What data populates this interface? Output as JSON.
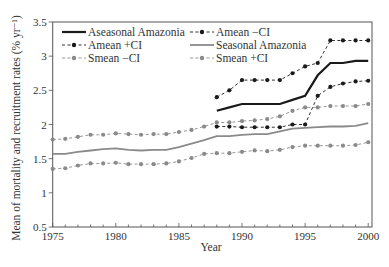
{
  "chart_data": {
    "type": "line",
    "title": "",
    "xlabel": "Year",
    "ylabel": "Mean of mortality and recruitment rates (% yr⁻¹)",
    "xlim": [
      1975,
      2000.3
    ],
    "ylim": [
      0.5,
      3.5
    ],
    "xticks": [
      1975,
      1980,
      1985,
      1990,
      1995,
      2000
    ],
    "xtick_labels": [
      "1975",
      "1980",
      "1985",
      "1990",
      "1995",
      "2000"
    ],
    "yticks": [
      0.5,
      1,
      1.5,
      2,
      2.5,
      3,
      3.5
    ],
    "ytick_labels": [
      "0.5",
      "1",
      "1.5",
      "2",
      "2.5",
      "3",
      "3.5"
    ],
    "grid": false,
    "legend_position": "upper left (inside, 3 columns x 2 rows)",
    "series": [
      {
        "name": "Aseasonal Amazonia",
        "style": "solid",
        "color": "#1a1a1a",
        "marker": "none",
        "width": 2.2,
        "x": [
          1988,
          1989,
          1990,
          1991,
          1992,
          1993,
          1994,
          1995,
          1996,
          1997,
          1998,
          1999,
          2000
        ],
        "values": [
          2.2,
          2.25,
          2.3,
          2.3,
          2.3,
          2.3,
          2.36,
          2.42,
          2.72,
          2.9,
          2.9,
          2.93,
          2.93
        ]
      },
      {
        "name": "Amean −CI",
        "style": "dashed",
        "color": "#1a1a1a",
        "marker": "dot",
        "x": [
          1988,
          1989,
          1990,
          1991,
          1992,
          1993,
          1994,
          1995,
          1996,
          1997,
          1998,
          1999,
          2000
        ],
        "values": [
          1.97,
          1.97,
          1.96,
          1.96,
          1.96,
          1.96,
          2.0,
          2.0,
          2.42,
          2.55,
          2.6,
          2.63,
          2.64
        ]
      },
      {
        "name": "Amean +CI",
        "style": "dashed",
        "color": "#1a1a1a",
        "marker": "dot",
        "x": [
          1988,
          1989,
          1990,
          1991,
          1992,
          1993,
          1994,
          1995,
          1996,
          1997,
          1998,
          1999,
          2000
        ],
        "values": [
          2.4,
          2.5,
          2.65,
          2.65,
          2.65,
          2.65,
          2.75,
          2.85,
          2.9,
          3.23,
          3.23,
          3.23,
          3.23
        ]
      },
      {
        "name": "Seasonal Amazonia",
        "style": "solid",
        "color": "#8a8a8a",
        "marker": "none",
        "width": 1.8,
        "x": [
          1975,
          1976,
          1977,
          1978,
          1979,
          1980,
          1981,
          1982,
          1983,
          1984,
          1985,
          1986,
          1987,
          1988,
          1989,
          1990,
          1991,
          1992,
          1993,
          1994,
          1995,
          1996,
          1997,
          1998,
          1999,
          2000
        ],
        "values": [
          1.57,
          1.57,
          1.6,
          1.62,
          1.64,
          1.65,
          1.63,
          1.62,
          1.63,
          1.63,
          1.67,
          1.72,
          1.77,
          1.83,
          1.83,
          1.85,
          1.86,
          1.86,
          1.9,
          1.94,
          1.95,
          1.96,
          1.97,
          1.97,
          1.98,
          2.02
        ]
      },
      {
        "name": "Smean −CI",
        "style": "dashed",
        "color": "#8a8a8a",
        "marker": "dot",
        "x": [
          1975,
          1976,
          1977,
          1978,
          1979,
          1980,
          1981,
          1982,
          1983,
          1984,
          1985,
          1986,
          1987,
          1988,
          1989,
          1990,
          1991,
          1992,
          1993,
          1994,
          1995,
          1996,
          1997,
          1998,
          1999,
          2000
        ],
        "values": [
          1.35,
          1.36,
          1.4,
          1.43,
          1.43,
          1.44,
          1.42,
          1.42,
          1.42,
          1.43,
          1.46,
          1.51,
          1.57,
          1.58,
          1.58,
          1.6,
          1.62,
          1.61,
          1.63,
          1.67,
          1.69,
          1.69,
          1.69,
          1.69,
          1.7,
          1.74
        ]
      },
      {
        "name": "Smean +CI",
        "style": "dashed",
        "color": "#8a8a8a",
        "marker": "dot",
        "x": [
          1975,
          1976,
          1977,
          1978,
          1979,
          1980,
          1981,
          1982,
          1983,
          1984,
          1985,
          1986,
          1987,
          1988,
          1989,
          1990,
          1991,
          1992,
          1993,
          1994,
          1995,
          1996,
          1997,
          1998,
          1999,
          2000
        ],
        "values": [
          1.78,
          1.79,
          1.82,
          1.85,
          1.85,
          1.87,
          1.86,
          1.85,
          1.86,
          1.86,
          1.89,
          1.92,
          1.97,
          2.03,
          2.03,
          2.05,
          2.06,
          2.08,
          2.12,
          2.2,
          2.25,
          2.25,
          2.27,
          2.27,
          2.27,
          2.3
        ]
      }
    ],
    "legend_order": [
      "Aseasonal Amazonia",
      "Amean −CI",
      "Amean +CI",
      "Seasonal Amazonia",
      "Smean −CI",
      "Smean +CI"
    ]
  },
  "colors": {
    "black_series": "#1a1a1a",
    "gray_series": "#8a8a8a",
    "axis": "#555555",
    "background": "#ffffff"
  }
}
